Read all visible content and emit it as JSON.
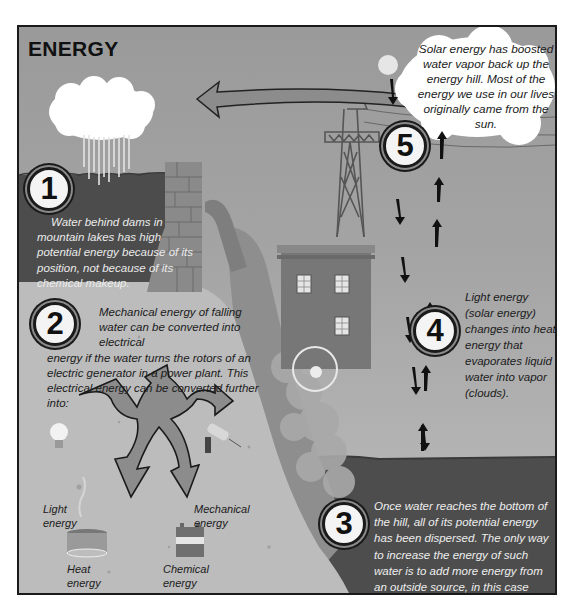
{
  "title": "ENERGY",
  "steps": [
    {
      "number": "1",
      "text": "Water behind dams in mountain lakes has high potential energy because of its position, not because of its chemical makeup."
    },
    {
      "number": "2",
      "text_lead": "Mechanical energy of falling water can be converted into electrical",
      "text_rest": "energy if the water turns the rotors of an electric generator in a power plant. This electrical energy can be converted further into:"
    },
    {
      "number": "3",
      "text": "Once water reaches the bottom of the hill, all of its potential energy has been dispersed. The only way to increase the energy of such water is to add more energy from an outside source, in this case from the sun."
    },
    {
      "number": "4",
      "text": "Light energy (solar energy) changes into heat energy that evaporates liquid water into vapor (clouds)."
    },
    {
      "number": "5",
      "text": "Solar energy has boosted water vapor back up the energy hill. Most of the energy we use in our lives originally came from the sun."
    }
  ],
  "energy_forms": [
    {
      "id": "light",
      "label": "Light energy",
      "icon": "light-bulb-icon"
    },
    {
      "id": "mechanical",
      "label": "Mechanical energy",
      "icon": "drill-icon"
    },
    {
      "id": "heat",
      "label": "Heat energy",
      "icon": "heating-pot-icon"
    },
    {
      "id": "chemical",
      "label": "Chemical energy",
      "icon": "battery-icon"
    }
  ],
  "colors": {
    "frame_border": "#1a1a1a",
    "sky": "#a4a4a4",
    "lake": "#4a4a4a",
    "ground": "#bdbdbd",
    "cloud": "#ffffff",
    "arrow_fill": "#8c8c8c"
  }
}
